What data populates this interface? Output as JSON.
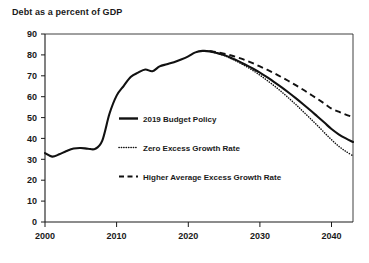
{
  "chart_data": {
    "type": "line",
    "title": "Debt as a percent of GDP",
    "xlabel": "",
    "ylabel": "",
    "xlim": [
      2000,
      2043
    ],
    "ylim": [
      0,
      90
    ],
    "yticks": [
      0,
      10,
      20,
      30,
      40,
      50,
      60,
      70,
      80,
      90
    ],
    "xticks": [
      2000,
      2010,
      2020,
      2030,
      2040
    ],
    "ytick_labels": [
      "0",
      "10",
      "20",
      "30",
      "40",
      "50",
      "60",
      "70",
      "80",
      "90"
    ],
    "xtick_labels": [
      "2000",
      "2010",
      "2020",
      "2030",
      "2040"
    ],
    "grid": false,
    "legend_position": "center",
    "series": [
      {
        "name": "2019 Budget Policy",
        "style": "solid",
        "x": [
          2000,
          2001,
          2002,
          2003,
          2004,
          2005,
          2006,
          2007,
          2008,
          2009,
          2010,
          2011,
          2012,
          2013,
          2014,
          2015,
          2016,
          2017,
          2018,
          2019,
          2020,
          2021,
          2022,
          2023,
          2024,
          2025,
          2026,
          2027,
          2028,
          2029,
          2030,
          2031,
          2032,
          2033,
          2034,
          2035,
          2036,
          2037,
          2038,
          2039,
          2040,
          2041,
          2042,
          2043
        ],
        "values": [
          33.0,
          31.3,
          32.4,
          34.0,
          35.2,
          35.4,
          35.1,
          35.0,
          39.0,
          51.8,
          60.5,
          65.2,
          69.5,
          71.5,
          73.0,
          72.2,
          74.5,
          75.5,
          76.5,
          77.8,
          79.3,
          81.2,
          81.9,
          81.7,
          80.9,
          79.9,
          78.5,
          77.0,
          75.3,
          73.5,
          71.5,
          69.3,
          67.0,
          64.6,
          62.0,
          59.3,
          56.5,
          53.6,
          50.6,
          47.6,
          44.5,
          42.0,
          40.0,
          38.3
        ]
      },
      {
        "name": "Zero Excess Growth Rate",
        "style": "dotted",
        "x": [
          2023,
          2024,
          2025,
          2026,
          2027,
          2028,
          2029,
          2030,
          2031,
          2032,
          2033,
          2034,
          2035,
          2036,
          2037,
          2038,
          2039,
          2040,
          2041,
          2042,
          2043
        ],
        "values": [
          81.7,
          80.8,
          79.7,
          78.2,
          76.5,
          74.6,
          72.6,
          70.3,
          67.8,
          65.2,
          62.4,
          59.4,
          56.3,
          53.0,
          49.7,
          46.3,
          42.8,
          39.4,
          36.3,
          33.8,
          31.7
        ]
      },
      {
        "name": "Higher Average Excess Growth Rate",
        "style": "dashed",
        "x": [
          2023,
          2024,
          2025,
          2026,
          2027,
          2028,
          2029,
          2030,
          2031,
          2032,
          2033,
          2034,
          2035,
          2036,
          2037,
          2038,
          2039,
          2040,
          2041,
          2042,
          2043
        ],
        "values": [
          81.8,
          81.3,
          80.6,
          79.7,
          78.6,
          77.4,
          76.0,
          74.5,
          72.9,
          71.2,
          69.4,
          67.5,
          65.5,
          63.4,
          61.2,
          59.0,
          56.7,
          54.3,
          52.8,
          51.4,
          50.2
        ]
      }
    ],
    "legend": [
      {
        "label": "2019 Budget Policy",
        "style": "solid"
      },
      {
        "label": "Zero Excess Growth Rate",
        "style": "dotted"
      },
      {
        "label": "Higher Average Excess Growth Rate",
        "style": "dashed"
      }
    ],
    "colors": {
      "line": "#111111",
      "axis": "#1a1a1a",
      "background": "#ffffff"
    }
  }
}
